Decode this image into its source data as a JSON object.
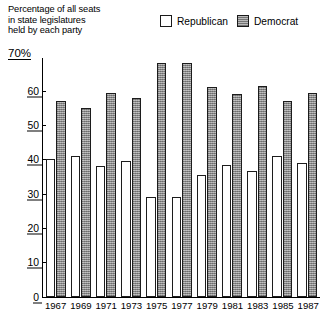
{
  "caption": {
    "line1": "Percentage of all seats",
    "line2": "in state legislatures",
    "line3": "held by each party"
  },
  "legend": {
    "republican": "Republican",
    "democrat": "Democrat",
    "republican_swatch": "empty-square-icon",
    "democrat_swatch": "shaded-square-icon"
  },
  "axis": {
    "top_label": "70%",
    "ticks": [
      "60",
      "50",
      "40",
      "30",
      "20",
      "10",
      "0"
    ]
  },
  "colors": {
    "republican": "#ffffff",
    "democrat": "#9d9d9d",
    "outline": "#1c1c1c",
    "background": "#ffffff"
  },
  "chart_data": {
    "type": "bar",
    "title": "Percentage of all seats in state legislatures held by each party",
    "xlabel": "",
    "ylabel": "70%",
    "ylim": [
      0,
      70
    ],
    "yticks": [
      0,
      10,
      20,
      30,
      40,
      50,
      60,
      70
    ],
    "grid": false,
    "legend_position": "top-right",
    "categories": [
      "1967",
      "1969",
      "1971",
      "1973",
      "1975",
      "1977",
      "1979",
      "1981",
      "1983",
      "1985",
      "1987"
    ],
    "series": [
      {
        "name": "Republican",
        "color": "#ffffff",
        "values": [
          40,
          41,
          38,
          39.5,
          29,
          29,
          35.5,
          38.5,
          36.5,
          41,
          39
        ]
      },
      {
        "name": "Democrat",
        "color": "#9d9d9d",
        "values": [
          57,
          55,
          59.5,
          58,
          68,
          68,
          61,
          59,
          61.5,
          57,
          59.5
        ]
      }
    ]
  }
}
